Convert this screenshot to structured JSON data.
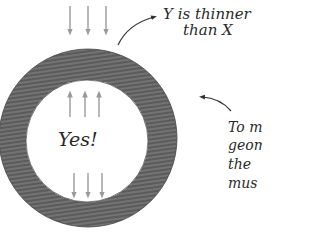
{
  "diagram": {
    "ring": {
      "outer": {
        "cx": 88,
        "cy": 138,
        "r": 89
      },
      "inner": {
        "cx": 87,
        "cy": 141,
        "r": 61
      },
      "fill_color": "#5e5e5e",
      "hatch_color": "#8a8a8a"
    },
    "arrows": {
      "color": "#9a9a9a",
      "top_down": [
        {
          "x": 70,
          "y1": 6,
          "y2": 34
        },
        {
          "x": 88,
          "y1": 6,
          "y2": 34
        },
        {
          "x": 106,
          "y1": 6,
          "y2": 34
        }
      ],
      "inner_up": [
        {
          "x": 70,
          "y1": 117,
          "y2": 92
        },
        {
          "x": 85,
          "y1": 117,
          "y2": 92
        },
        {
          "x": 99,
          "y1": 117,
          "y2": 92
        }
      ],
      "inner_down": [
        {
          "x": 74,
          "y1": 173,
          "y2": 197
        },
        {
          "x": 88,
          "y1": 173,
          "y2": 197
        },
        {
          "x": 102,
          "y1": 173,
          "y2": 197
        }
      ]
    },
    "labels": {
      "y_thinner_line1": "Y is thinner",
      "y_thinner_line2": "than X",
      "center": "Yes!",
      "note_line1": "To m",
      "note_line2": "geom",
      "note_line3": "the",
      "note_line4": "mus"
    }
  }
}
